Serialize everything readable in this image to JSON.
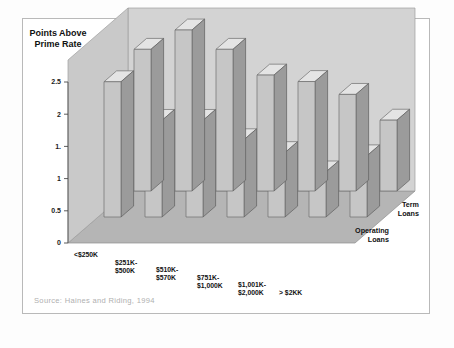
{
  "figure": {
    "title": "Interest Rates on SME Loans",
    "ylabel_line1": "Points Above",
    "ylabel_line2": "Prime Rate",
    "source": "Source: Haines and Riding, 1994",
    "colors": {
      "bar_front": "#c6c6c6",
      "bar_side": "#9b9b9b",
      "bar_top": "#e4e4e4",
      "back_wall": "#d3d3d3",
      "side_wall": "#c9c9c9",
      "floor": "#b5b5b5",
      "frame_border": "#b9b9b9",
      "text": "#111111",
      "source_text": "#b0b0b0"
    }
  },
  "chart_data": {
    "type": "bar",
    "style": "3d-clustered",
    "title": "Interest Rates on SME Loans",
    "xlabel": "",
    "ylabel": "Points Above Prime Rate",
    "ylim": [
      0,
      2.5
    ],
    "yticks": [
      0,
      0.5,
      1,
      1.5,
      2,
      2.5
    ],
    "ytick_labels": [
      "0",
      "0.5",
      "1",
      "1.",
      "2",
      "2.5"
    ],
    "grid": false,
    "legend_position": "depth-axis-right",
    "categories": [
      "<$250K",
      "$251K-$500K",
      "$510K-$570K",
      "$751K-$1,000K",
      "$1,001K-$2,000K",
      "> $2KK",
      ""
    ],
    "category_lines": [
      [
        "<$250K"
      ],
      [
        "$251K-",
        "$500K"
      ],
      [
        "$510K-",
        "$570K"
      ],
      [
        "$751K-",
        "$1,000K"
      ],
      [
        "$1,001K-",
        "$2,000K"
      ],
      [
        "> $2KK"
      ],
      [
        ""
      ]
    ],
    "series": [
      {
        "name": "Term Loans",
        "label_lines": [
          "Term",
          "Loans"
        ],
        "values": [
          2.2,
          2.5,
          2.2,
          1.8,
          1.7,
          1.5,
          1.1
        ]
      },
      {
        "name": "Operating Loans",
        "label_lines": [
          "Operating",
          "Loans"
        ],
        "values": [
          2.1,
          1.5,
          1.5,
          1.2,
          1.0,
          0.7,
          0.95
        ]
      }
    ]
  }
}
